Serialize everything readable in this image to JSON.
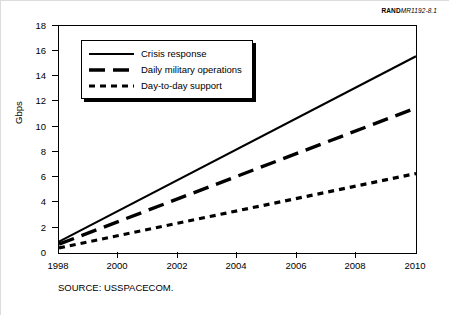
{
  "figure_id": {
    "brand": "RAND",
    "number": "MR1192-8.1"
  },
  "source_note": "SOURCE:  USSPACECOM.",
  "legend": {
    "items": [
      {
        "label": "Crisis response",
        "style": "solid",
        "swatch_icon": "solid-line-icon"
      },
      {
        "label": "Daily military operations",
        "style": "dashed",
        "swatch_icon": "dashed-line-icon"
      },
      {
        "label": "Day-to-day support",
        "style": "dotted",
        "swatch_icon": "dotted-line-icon"
      }
    ]
  },
  "chart_data": {
    "type": "line",
    "title": "",
    "subtitle": "",
    "xlabel": "",
    "ylabel": "Gbps",
    "xlim": [
      1998,
      2010
    ],
    "ylim": [
      0,
      18
    ],
    "grid": false,
    "legend_position": "upper-left-inside",
    "x": [
      1998,
      2010
    ],
    "xticks": [
      1998,
      2000,
      2002,
      2004,
      2006,
      2008,
      2010
    ],
    "xtick_labels": [
      "1998",
      "2000",
      "2002",
      "2004",
      "2006",
      "2008",
      "2010"
    ],
    "yticks": [
      0,
      2,
      4,
      6,
      8,
      10,
      12,
      14,
      16,
      18
    ],
    "ytick_labels": [
      "0",
      "2",
      "4",
      "6",
      "8",
      "10",
      "12",
      "14",
      "16",
      "18"
    ],
    "series": [
      {
        "name": "Crisis response",
        "style": "solid",
        "color": "#000000",
        "x": [
          1998,
          2010
        ],
        "values": [
          0.9,
          15.6
        ]
      },
      {
        "name": "Daily military operations",
        "style": "dashed",
        "color": "#000000",
        "x": [
          1998,
          2010
        ],
        "values": [
          0.7,
          11.5
        ]
      },
      {
        "name": "Day-to-day support",
        "style": "dotted",
        "color": "#000000",
        "x": [
          1998,
          2010
        ],
        "values": [
          0.4,
          6.3
        ]
      }
    ]
  }
}
